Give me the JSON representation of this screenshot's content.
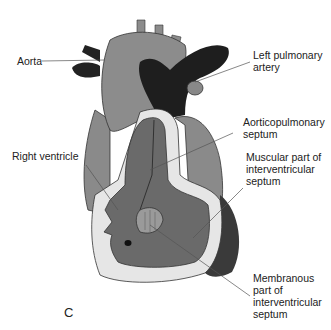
{
  "figure_letter": "C",
  "labels": {
    "aorta": "Aorta",
    "left_pulmonary_artery": "Left pulmonary\nartery",
    "aorticopulmonary_septum": "Aorticopulmonary\nseptum",
    "right_ventricle": "Right ventricle",
    "muscular_septum": "Muscular part of\ninterventricular\nseptum",
    "membranous_septum": "Membranous\npart of\ninterventricular\nseptum"
  },
  "colors": {
    "aorta": "#8c8c8c",
    "pulmonary": "#1e1e1e",
    "ventricle": "#6a6a6a",
    "wall_light": "#e6e6e6",
    "leader": "#555555"
  }
}
